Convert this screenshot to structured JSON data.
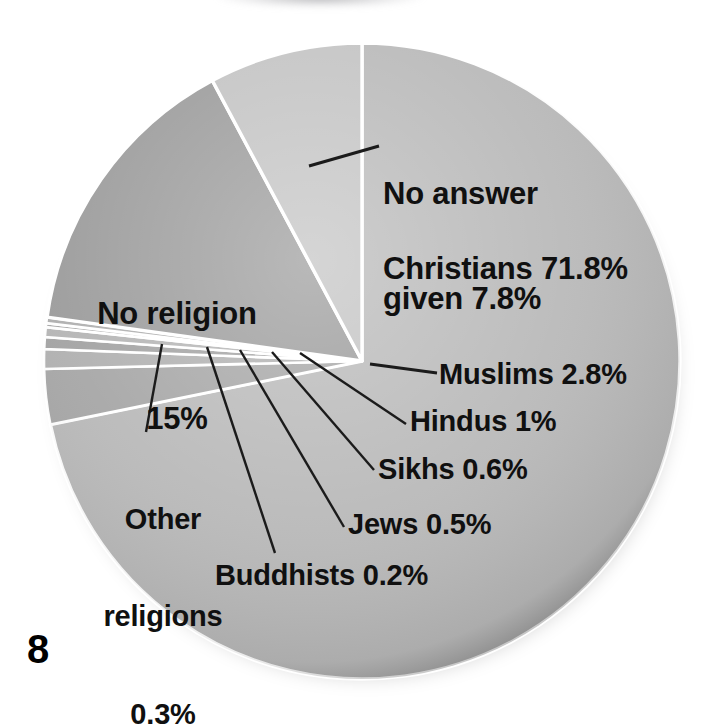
{
  "page": {
    "number": "8"
  },
  "chart_data": {
    "type": "pie",
    "title": "",
    "xlabel": "",
    "ylabel": "",
    "unit": "%",
    "legend_position": "none",
    "grid": false,
    "start_angle_deg": 0,
    "direction": "clockwise",
    "categories": [
      "Christians",
      "Muslims",
      "Hindus",
      "Sikhs",
      "Jews",
      "Buddhists",
      "Other religions",
      "No religion",
      "No answer given"
    ],
    "values": [
      71.8,
      2.8,
      1.0,
      0.6,
      0.5,
      0.2,
      0.3,
      15.0,
      7.8
    ],
    "labels": [
      "Christians 71.8%",
      "Muslims 2.8%",
      "Hindus 1%",
      "Sikhs 0.6%",
      "Jews 0.5%",
      "Buddhists 0.2%",
      "Other religions 0.3%",
      "No religion 15%",
      "No answer given 7.8%"
    ],
    "slice_colors": [
      "#b9b9b9",
      "#a6a6a6",
      "#b0b0b0",
      "#a2a2a2",
      "#b4b4b4",
      "#a8a8a8",
      "#aeaeae",
      "#9b9b9b",
      "#c3c3c3"
    ],
    "separator_color": "#ffffff",
    "leader_line_color": "#1b1b1b",
    "text_color": "#101010",
    "background": "#ffffff"
  },
  "labels": {
    "christians": "Christians 71.8%",
    "no_answer_line1": "No answer",
    "no_answer_line2": "given 7.8%",
    "no_religion_line1": "No religion",
    "no_religion_line2": "15%",
    "muslims": "Muslims 2.8%",
    "hindus": "Hindus 1%",
    "sikhs": "Sikhs 0.6%",
    "jews": "Jews 0.5%",
    "buddhists": "Buddhists 0.2%",
    "other_line1": "Other",
    "other_line2": "religions",
    "other_line3": "0.3%"
  }
}
